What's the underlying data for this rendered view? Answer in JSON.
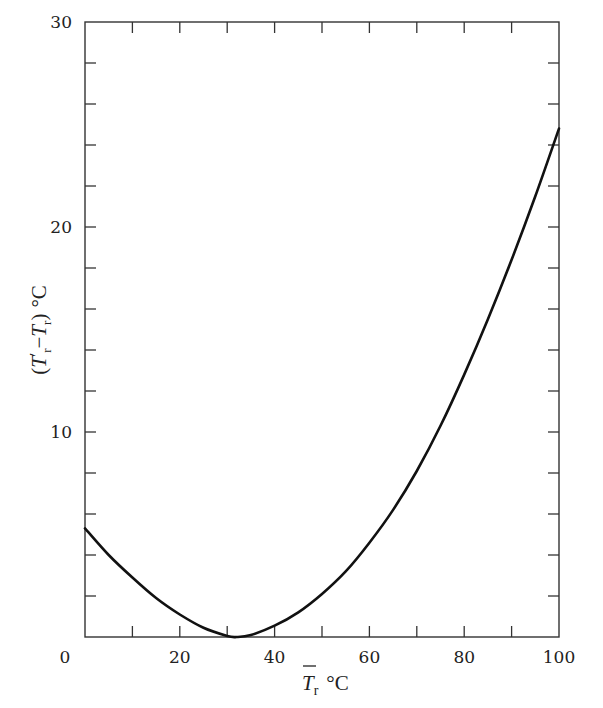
{
  "chart_data": {
    "type": "line",
    "title": "",
    "xlabel": "T̄r °C",
    "ylabel": "(T̄′r − T̄r) °C",
    "xlim": [
      0,
      100
    ],
    "ylim": [
      0,
      30
    ],
    "grid": false,
    "legend": null,
    "x_ticks_major": [
      0,
      20,
      40,
      60,
      80,
      100
    ],
    "x_tick_labels": [
      "0",
      "20",
      "40",
      "60",
      "80",
      "100"
    ],
    "x_ticks_minor_step": 10,
    "y_ticks_major": [
      10,
      20,
      30
    ],
    "y_tick_labels": [
      "10",
      "20",
      "30"
    ],
    "y_ticks_minor_step": 2,
    "series": [
      {
        "name": "T̄′r − T̄r",
        "color": "#111111",
        "x": [
          0,
          5,
          10,
          15,
          20,
          25,
          30,
          32,
          35,
          40,
          45,
          50,
          55,
          60,
          65,
          70,
          75,
          80,
          85,
          90,
          95,
          100
        ],
        "y": [
          5.3,
          4.0,
          2.9,
          1.9,
          1.1,
          0.45,
          0.05,
          0.0,
          0.1,
          0.55,
          1.2,
          2.1,
          3.2,
          4.6,
          6.2,
          8.1,
          10.3,
          12.8,
          15.5,
          18.4,
          21.5,
          24.8
        ]
      }
    ]
  },
  "labels": {
    "x_axis_main": "T",
    "x_axis_sub": "r",
    "x_axis_unit": "°C",
    "y_axis_open": "(",
    "y_axis_t1": "T",
    "y_axis_prime": "′",
    "y_axis_sub1": "r",
    "y_axis_minus": "−",
    "y_axis_t2": "T",
    "y_axis_sub2": "r",
    "y_axis_close": ")",
    "y_axis_unit": "°C"
  }
}
